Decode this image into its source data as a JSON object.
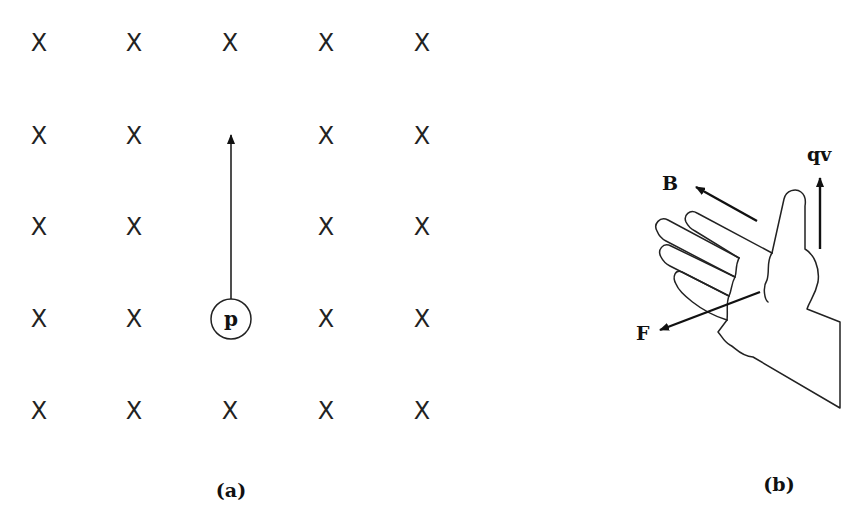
{
  "panel_a": {
    "caption": "(a)",
    "field_symbol": "X",
    "field_grid": {
      "rows": 5,
      "cols": 5,
      "x_positions": [
        39,
        134,
        230,
        326,
        422
      ],
      "y_positions": [
        42,
        135,
        226,
        318,
        410
      ],
      "omitted_cells": [
        [
          1,
          2
        ],
        [
          2,
          2
        ],
        [
          3,
          2
        ]
      ]
    },
    "particle": {
      "label": "p",
      "cx": 231,
      "cy": 319,
      "r": 20
    },
    "velocity_arrow": {
      "x": 231,
      "y_start": 299,
      "y_end": 133
    }
  },
  "panel_b": {
    "caption": "(b)",
    "labels": {
      "B": "B",
      "qv": "qv",
      "F": "F"
    },
    "vectors": {
      "B": {
        "from": [
          757,
          221
        ],
        "to": [
          696,
          187
        ]
      },
      "qv": {
        "from": [
          820,
          249
        ],
        "to": [
          820,
          178
        ]
      },
      "F": {
        "from": [
          760,
          292
        ],
        "to": [
          660,
          330
        ]
      }
    }
  },
  "colors": {
    "ink": "#111111",
    "background": "#ffffff"
  }
}
